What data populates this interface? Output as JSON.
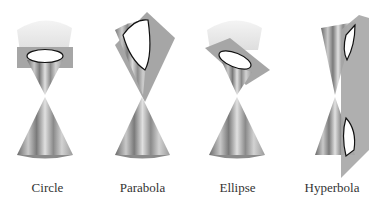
{
  "figure": {
    "panels": [
      {
        "id": "circle",
        "label": "Circle"
      },
      {
        "id": "parabola",
        "label": "Parabola"
      },
      {
        "id": "ellipse",
        "label": "Ellipse"
      },
      {
        "id": "hyperbola",
        "label": "Hyperbola"
      }
    ],
    "colors": {
      "plane": "#a6a6a6",
      "cone_dark": "#5a5a5a",
      "cone_light": "#d8d8d8",
      "section_fill": "#ffffff",
      "section_stroke": "#111111"
    }
  }
}
